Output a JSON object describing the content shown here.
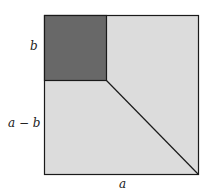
{
  "diagram": {
    "colors": {
      "outer_fill": "#dcdcdc",
      "inner_fill": "#686868",
      "stroke": "#1a1a1a",
      "background": "#ffffff"
    },
    "labels": {
      "top_side": "b",
      "lower_side": "a − b",
      "bottom_side": "a"
    },
    "shapes": {
      "outer_square": "side a",
      "inner_square": "side b (top-left corner, dark)",
      "diagonal": "from inner square's bottom-right corner to outer square's bottom-right corner"
    }
  }
}
